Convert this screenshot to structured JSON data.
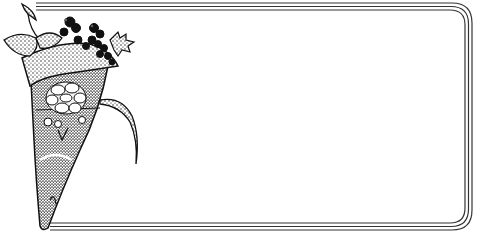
{
  "illustration": {
    "subject": "decorative frame with floral cone bouquet",
    "colors": {
      "ink": "#111111",
      "border": "#333333",
      "background": "#ffffff",
      "shading": "#555555",
      "highlight": "#dddddd"
    },
    "frame": {
      "style": "triple-line rounded rectangle",
      "lines": 3
    },
    "bouquet": {
      "elements": [
        "paper cone",
        "rose / succulent bloom",
        "holly leaf",
        "berry cluster",
        "ribbon",
        "folded leaves"
      ]
    }
  }
}
